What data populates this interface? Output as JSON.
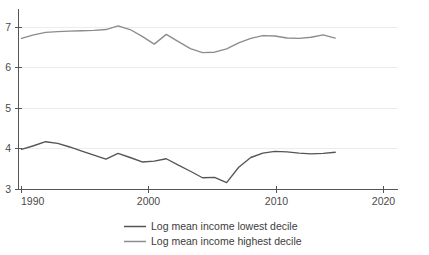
{
  "chart_data": {
    "type": "line",
    "title": "",
    "subtitle": "",
    "xlabel": "",
    "ylabel": "",
    "xlim": [
      1990,
      2021.5
    ],
    "ylim": [
      3,
      7.42
    ],
    "grid": true,
    "grid_axis": "y",
    "legend_position": "bottom-center",
    "x_ticks": [
      1990,
      2000,
      2010,
      2020
    ],
    "x_tick_labels": [
      "1990",
      "2000",
      "2010",
      "2020"
    ],
    "y_ticks": [
      3,
      4,
      5,
      6,
      7
    ],
    "y_tick_labels": [
      "3",
      "4",
      "5",
      "6",
      "7"
    ],
    "series": [
      {
        "name": "Log mean income lowest decile",
        "color": "#555555",
        "x": [
          1990,
          1991,
          1992,
          1993,
          1994,
          1995,
          1996,
          1997,
          1998,
          1999,
          2000,
          2001,
          2002,
          2003,
          2004,
          2005,
          2006,
          2007,
          2008,
          2009,
          2010,
          2011,
          2012,
          2013,
          2014,
          2015,
          2016
        ],
        "values": [
          3.99,
          4.08,
          4.18,
          4.14,
          4.05,
          3.95,
          3.85,
          3.75,
          3.89,
          3.79,
          3.68,
          3.7,
          3.76,
          3.6,
          3.45,
          3.29,
          3.3,
          3.17,
          3.55,
          3.79,
          3.9,
          3.94,
          3.93,
          3.9,
          3.88,
          3.89,
          3.92
        ]
      },
      {
        "name": "Log mean income highest decile",
        "color": "#8c8c8c",
        "x": [
          1990,
          1991,
          1992,
          1993,
          1994,
          1995,
          1996,
          1997,
          1998,
          1999,
          2000,
          2001,
          2002,
          2003,
          2004,
          2005,
          2006,
          2007,
          2008,
          2009,
          2010,
          2011,
          2012,
          2013,
          2014,
          2015,
          2016
        ],
        "values": [
          6.73,
          6.82,
          6.88,
          6.9,
          6.91,
          6.92,
          6.93,
          6.95,
          7.04,
          6.95,
          6.78,
          6.59,
          6.83,
          6.65,
          6.48,
          6.38,
          6.39,
          6.47,
          6.62,
          6.73,
          6.8,
          6.79,
          6.74,
          6.73,
          6.76,
          6.82,
          6.74
        ]
      }
    ]
  },
  "legend": {
    "items": [
      {
        "label": "Log mean income lowest decile",
        "color": "#555555"
      },
      {
        "label": "Log mean income highest decile",
        "color": "#8c8c8c"
      }
    ]
  },
  "axes": {
    "y_labels": [
      "7",
      "6",
      "5",
      "4",
      "3"
    ],
    "x_labels": [
      "1990",
      "2000",
      "2010",
      "2020"
    ]
  }
}
